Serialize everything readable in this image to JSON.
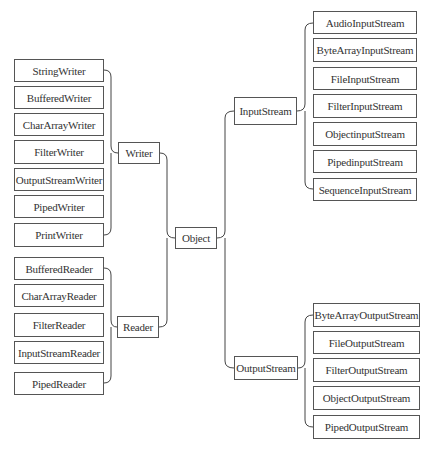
{
  "diagram": {
    "root": {
      "label": "Object"
    },
    "writer": {
      "label": "Writer",
      "children": [
        "StringWriter",
        "BufferedWriter",
        "CharArrayWriter",
        "FilterWriter",
        "OutputStreamWriter",
        "PipedWriter",
        "PrintWriter"
      ]
    },
    "reader": {
      "label": "Reader",
      "children": [
        "BufferedReader",
        "CharArrayReader",
        "FilterReader",
        "InputStreamReader",
        "PipedReader"
      ]
    },
    "input_stream": {
      "label": "InputStream",
      "children": [
        "AudioInputStream",
        "ByteArrayInputStream",
        "FileInputStream",
        "FilterInputStream",
        "ObjectinputStream",
        "PipedinputStream",
        "SequenceInputStream"
      ]
    },
    "output_stream": {
      "label": "OutputStream",
      "children": [
        "ByteArrayOutputStream",
        "FileOutputStream",
        "FilterOutputStream",
        "ObjectOutputStream",
        "PipedOutputStream"
      ]
    },
    "colors": {
      "line": "#444444",
      "border": "#555555",
      "text": "#333333",
      "background": "#ffffff"
    }
  }
}
